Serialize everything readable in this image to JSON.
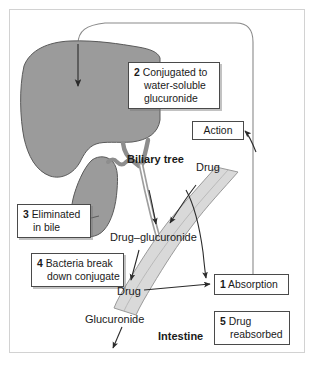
{
  "figure": {
    "frame_color": "#d2d2d2",
    "background": "#ffffff"
  },
  "colors": {
    "liver_fill": "#9b9b9b",
    "gallbladder_fill": "#9b9b9b",
    "duct_fill": "#c9c9c9",
    "intestine_fill": "#d9d9d9",
    "outline": "#4a4a4a",
    "text": "#1a1a1a",
    "loop_line": "#8a8a8a"
  },
  "callouts": [
    {
      "id": "box2",
      "number": "2",
      "line1": "Conjugated to",
      "line2": "water-soluble",
      "line3": "glucuronide"
    },
    {
      "id": "box3",
      "number": "3",
      "line1": "Eliminated",
      "line2": "in bile",
      "line3": ""
    },
    {
      "id": "box4",
      "number": "4",
      "line1": "Bacteria break",
      "line2": "down conjugate",
      "line3": ""
    },
    {
      "id": "box1",
      "number": "1",
      "line1": "Absorption",
      "line2": "",
      "line3": ""
    },
    {
      "id": "box5",
      "number": "5",
      "line1": "Drug",
      "line2": "reabsorbed",
      "line3": ""
    }
  ],
  "action_box": {
    "label": "Action"
  },
  "labels": {
    "biliary_tree": "Biliary tree",
    "drug_top": "Drug",
    "drug_glucuronide": "Drug–glucuronide",
    "drug_mid": "Drug",
    "glucuronide": "Glucuronide",
    "intestine": "Intestine"
  },
  "anatomy": {
    "liver": "liver",
    "gallbladder": "gallbladder",
    "bile_duct": "common-bile-duct",
    "intestine_tube": "intestine"
  }
}
